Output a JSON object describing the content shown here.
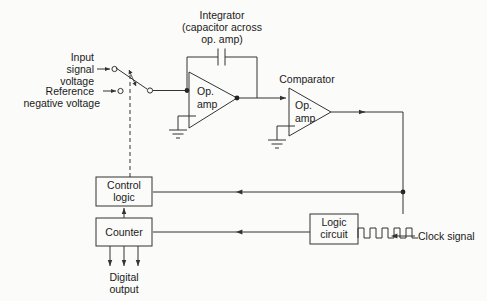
{
  "diagram": {
    "background_color": "#fbfbf9",
    "line_color": "#333333",
    "text_color": "#1a1a1a"
  },
  "labels": {
    "input_signal_line1": "Input",
    "input_signal_line2": "signal",
    "input_signal_line3": "voltage",
    "reference_line1": "Reference",
    "reference_line2": "negative voltage",
    "integrator_line1": "Integrator",
    "integrator_line2": "(capacitor across",
    "integrator_line3": "op. amp)",
    "comparator": "Comparator",
    "op_amp_line1": "Op.",
    "op_amp_line2": "amp",
    "control_logic_line1": "Control",
    "control_logic_line2": "logic",
    "counter": "Counter",
    "logic_circuit_line1": "Logic",
    "logic_circuit_line2": "circuit",
    "clock_signal": "Clock signal",
    "digital_output_line1": "Digital",
    "digital_output_line2": "output"
  },
  "blocks": [
    {
      "id": "integrator-op-amp",
      "name": "Op. amp",
      "role": "integrator"
    },
    {
      "id": "comparator-op-amp",
      "name": "Op. amp",
      "role": "comparator"
    },
    {
      "id": "control-logic",
      "name": "Control logic",
      "role": "control"
    },
    {
      "id": "counter",
      "name": "Counter",
      "role": "counter"
    },
    {
      "id": "logic-circuit",
      "name": "Logic circuit",
      "role": "logic"
    }
  ],
  "signals": {
    "clock_pulse_count": 5,
    "digital_output_bit_lines": 3,
    "switch_positions": 2
  },
  "components": {
    "capacitor": "feedback-capacitor",
    "grounds": 2,
    "switch": "input-selector-switch"
  }
}
